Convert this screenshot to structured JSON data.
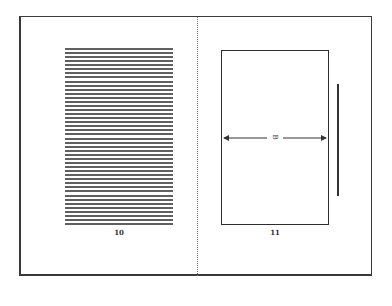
{
  "spread": {
    "left_page": {
      "page_number": "10",
      "text_block": {
        "line_count": 44,
        "description": "placeholder text lines"
      }
    },
    "right_page": {
      "page_number": "11",
      "image_frame": {
        "dimension_label": "B"
      }
    }
  },
  "colors": {
    "frame": "#3a3a3a",
    "lines": "#444444",
    "divider": "#777777"
  }
}
